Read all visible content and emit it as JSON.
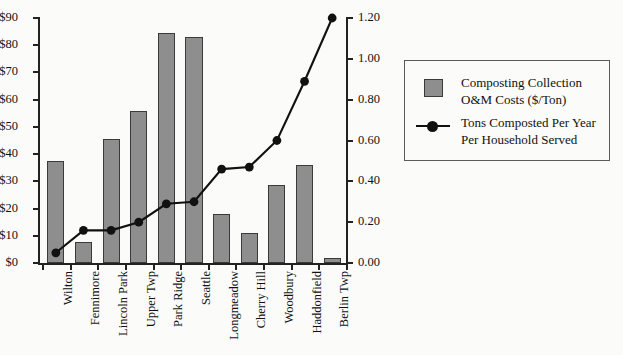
{
  "chart_data": {
    "type": "bar",
    "title": "",
    "subtitle": "",
    "xlabel": "",
    "ylabel": "",
    "y2label": "",
    "grid": false,
    "legend_position": "right",
    "categories": [
      "Wilton",
      "Fennimore",
      "Lincoln Park",
      "Upper Twp",
      "Park Ridge",
      "Seattle",
      "Longmeadow",
      "Cherry Hill",
      "Woodbury",
      "Haddonfield",
      "Berlin Twp"
    ],
    "series": [
      {
        "name": "Composting Collection O&M Costs ($/Ton)",
        "type": "bar",
        "axis": "left",
        "values": [
          37.5,
          7.8,
          45.5,
          55.8,
          84.5,
          83.0,
          18.0,
          11.0,
          28.5,
          36.0,
          2.0
        ]
      },
      {
        "name": "Tons Composted Per Year Per Household Served",
        "type": "line",
        "axis": "right",
        "values": [
          0.05,
          0.16,
          0.16,
          0.2,
          0.29,
          0.3,
          0.46,
          0.47,
          0.6,
          0.89,
          1.2
        ]
      }
    ],
    "ylim": [
      0,
      90
    ],
    "yticks": [
      0,
      10,
      20,
      30,
      40,
      50,
      60,
      70,
      80,
      90
    ],
    "ytick_labels": [
      "$0",
      "$10",
      "$20",
      "$30",
      "$40",
      "$50",
      "$60",
      "$70",
      "$80",
      "$90"
    ],
    "y2lim": [
      0,
      1.2
    ],
    "y2ticks": [
      0,
      0.2,
      0.4,
      0.6,
      0.8,
      1.0,
      1.2
    ],
    "y2tick_labels": [
      "0.00",
      "0.20",
      "0.40",
      "0.60",
      "0.80",
      "1.00",
      "1.20"
    ],
    "colors": {
      "bar_fill": "#8e8e8e",
      "bar_stroke": "#3a3a3a",
      "line": "#111111",
      "axis": "#222222",
      "background": "#fbfbf9"
    }
  },
  "legend": {
    "entries": [
      {
        "marker": "bar-swatch",
        "line1": "Composting Collection",
        "line2": "O&M Costs ($/Ton)"
      },
      {
        "marker": "line-marker",
        "line1": "Tons Composted Per Year",
        "line2": "Per Household Served"
      }
    ]
  }
}
